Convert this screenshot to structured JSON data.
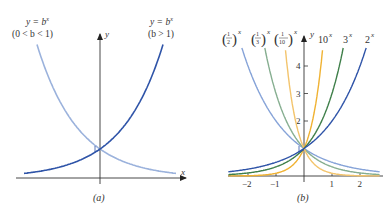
{
  "chart_data": [
    {
      "type": "line",
      "panel": "a",
      "caption": "(a)",
      "xlabel": "x",
      "ylabel": "y",
      "ticks": false,
      "series": [
        {
          "name": "y = b^x (0 < b < 1)",
          "label_line1": "y = b",
          "label_sup": "x",
          "label_line2": "(0 < b < 1)",
          "color": "#9bb2dc",
          "kind": "decay"
        },
        {
          "name": "y = b^x (b > 1)",
          "label_line1": "y = b",
          "label_sup": "x",
          "label_line2": "(b > 1)",
          "color": "#2f54a8",
          "kind": "growth"
        }
      ]
    },
    {
      "type": "line",
      "panel": "b",
      "caption": "(b)",
      "xlabel": "x",
      "ylabel": "y",
      "xlim": [
        -2.7,
        2.7
      ],
      "ylim": [
        0,
        4.8
      ],
      "xticks": [
        -2,
        -1,
        1,
        2
      ],
      "xtick_labels": [
        "−2",
        "−1",
        "1",
        "2"
      ],
      "yticks": [
        2,
        3,
        4
      ],
      "ytick_labels": [
        "2",
        "3",
        "4"
      ],
      "series": [
        {
          "name": "(1/2)^x",
          "base": 0.5,
          "color": "#86a3d8"
        },
        {
          "name": "(1/3)^x",
          "base": 0.3333,
          "color": "#86ae90"
        },
        {
          "name": "(1/10)^x",
          "base": 0.1,
          "color": "#f3c46c"
        },
        {
          "name": "10^x",
          "base": 10,
          "color": "#f0b232"
        },
        {
          "name": "3^x",
          "base": 3,
          "color": "#3f7f4a"
        },
        {
          "name": "2^x",
          "base": 2,
          "color": "#2f54a8"
        }
      ],
      "labels": {
        "half": {
          "num": "1",
          "den": "2",
          "sup": "x"
        },
        "third": {
          "num": "1",
          "den": "3",
          "sup": "x"
        },
        "tenth": {
          "num": "1",
          "den": "10",
          "sup": "x"
        },
        "ten": {
          "base": "10",
          "sup": "x"
        },
        "three": {
          "base": "3",
          "sup": "x"
        },
        "two": {
          "base": "2",
          "sup": "x"
        }
      }
    }
  ]
}
